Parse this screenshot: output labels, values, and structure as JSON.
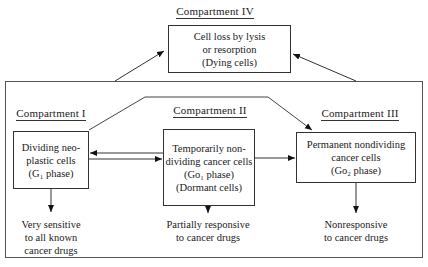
{
  "compartments": [
    {
      "id": "IV",
      "title": "Compartment IV",
      "box_lines": [
        "Cell loss by lysis",
        "or resorption",
        "(Dying cells)"
      ]
    },
    {
      "id": "I",
      "title": "Compartment I",
      "box_lines": [
        "Dividing neo-",
        "plastic cells",
        "(G₁ phase)"
      ],
      "response_lines": [
        "Very sensitive",
        "to all known",
        "cancer drugs"
      ]
    },
    {
      "id": "II",
      "title": "Compartment II",
      "box_lines": [
        "Temporarily non-",
        "dividing cancer cells",
        "(Go₁ phase)",
        "(Dormant cells)"
      ],
      "response_lines": [
        "Partially responsive",
        "to cancer drugs"
      ]
    },
    {
      "id": "III",
      "title": "Compartment III",
      "box_lines": [
        "Permanent nondividing",
        "cancer cells",
        "(Go₂ phase)"
      ],
      "response_lines": [
        "Nonresponsive",
        "to cancer drugs"
      ]
    }
  ],
  "connections": [
    {
      "from": "outer-frame",
      "to": "IV",
      "type": "arrow"
    },
    {
      "from": "outer-frame",
      "to": "IV",
      "type": "arrow"
    },
    {
      "from": "I",
      "to": "II",
      "type": "arrow"
    },
    {
      "from": "II",
      "to": "I",
      "type": "arrow"
    },
    {
      "from": "I",
      "to": "III",
      "type": "arrow",
      "route": "over-top"
    },
    {
      "from": "II",
      "to": "III",
      "type": "arrow"
    },
    {
      "from": "I",
      "to": "I-response",
      "type": "arrow"
    },
    {
      "from": "II",
      "to": "II-response",
      "type": "arrow"
    },
    {
      "from": "III",
      "to": "III-response",
      "type": "arrow"
    }
  ]
}
